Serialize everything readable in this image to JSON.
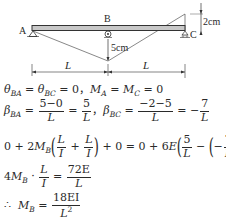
{
  "diagram": {
    "labels": {
      "a": "A",
      "b": "B",
      "c": "C",
      "deflection_c": "2cm",
      "deflection_b": "5cm",
      "span_ab": "L",
      "span_bc": "L"
    },
    "colors": {
      "beam_fill": "#c8c8c8",
      "line": "#333333"
    }
  },
  "equations": {
    "line1": {
      "theta": "θ",
      "sub_ba": "BA",
      "eq1": " = ",
      "theta2": "θ",
      "sub_bc": "BC",
      "rhs": " = 0，",
      "m": "M",
      "sub_a": "A",
      "eq2": " = ",
      "m2": "M",
      "sub_c": "C",
      "rhs2": " = 0"
    },
    "line2": {
      "beta": "β",
      "sub_ba": "BA",
      "eq": " = ",
      "num1": "5−0",
      "den1": "L",
      "eq2": " = ",
      "num2": "5",
      "den2": "L",
      "sep": "，",
      "beta2": "β",
      "sub_bc": "BC",
      "eq3": " = ",
      "num3": "−2−5",
      "den3": "L",
      "eq4": " = −",
      "num4": "7",
      "den4": "L"
    },
    "line3": {
      "lhs_start": "0 + 2",
      "m": "M",
      "sub_b": "B",
      "n1": "L",
      "d1": "I",
      "plus": " + ",
      "n2": "L",
      "d2": "I",
      "mid": " + 0 = 0 + 6",
      "e": "E",
      "n3": "5",
      "d3": "L",
      "minus": " − ",
      "neg": "−",
      "n4": "7",
      "d4": "L"
    },
    "line4": {
      "coef": "4",
      "m": "M",
      "sub_b": "B",
      "dot": " · ",
      "n1": "L",
      "d1": "I",
      "eq": " = ",
      "n2": "72E",
      "d2": "L"
    },
    "line5": {
      "therefore": "∴",
      "m": "M",
      "sub_b": "B",
      "eq": " = ",
      "num": "18EI",
      "den": "L",
      "den_sup": "2"
    }
  }
}
